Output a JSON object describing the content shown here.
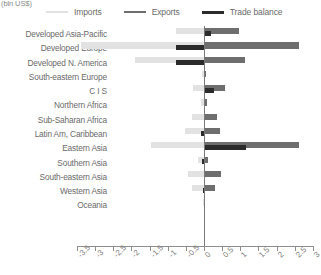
{
  "unit_label": "(bln US$)",
  "legend": {
    "position": "top",
    "items": [
      {
        "label": "Imports",
        "color": "#e2e2e2",
        "icon": "line-swatch-icon"
      },
      {
        "label": "Exports",
        "color": "#6e6e6e",
        "icon": "line-swatch-icon"
      },
      {
        "label": "Trade balance",
        "color": "#2b2b2b",
        "icon": "line-swatch-icon"
      }
    ]
  },
  "chart_data": {
    "type": "bar",
    "orientation": "horizontal",
    "title": "",
    "subtitle": "",
    "xlabel": "(bln US$)",
    "ylabel": "",
    "xlim": [
      -3.5,
      3.0
    ],
    "grid": false,
    "legend_position": "top",
    "zero_line": 0,
    "xticks": [
      -3.5,
      -3,
      -2.5,
      -2,
      -1.5,
      -1,
      -0.5,
      0,
      0.5,
      1,
      1.5,
      2,
      2.5,
      3
    ],
    "xticklabels": [
      "-3.5",
      "-3",
      "-2.5",
      "-2",
      "-1.5",
      "-1",
      "-0.5",
      "0",
      "0.5",
      "1",
      "1.5",
      "2",
      "2.5",
      "3"
    ],
    "categories": [
      "Developed Asia-Pacific",
      "Developed Europe",
      "Developed N. America",
      "South-eastern Europe",
      "C I S",
      "Northern Africa",
      "Sub-Saharan Africa",
      "Latin Am, Caribbean",
      "Eastern Asia",
      "Southern Asia",
      "South-eastern Asia",
      "Western Asia",
      "Oceania"
    ],
    "series": [
      {
        "name": "Imports",
        "color": "#e2e2e2",
        "values": [
          -0.78,
          -3.4,
          -1.9,
          -0.05,
          -0.3,
          -0.08,
          -0.32,
          -0.52,
          -1.45,
          -0.16,
          -0.44,
          -0.34,
          -0.02
        ]
      },
      {
        "name": "Exports",
        "color": "#6e6e6e",
        "values": [
          0.96,
          2.62,
          1.12,
          0.05,
          0.58,
          0.09,
          0.36,
          0.43,
          2.62,
          0.1,
          0.48,
          0.3,
          0.02
        ]
      },
      {
        "name": "Trade balance",
        "color": "#2b2b2b",
        "values": [
          0.18,
          -0.78,
          -0.78,
          0.0,
          0.28,
          0.01,
          0.04,
          -0.09,
          1.17,
          -0.06,
          0.04,
          -0.04,
          0.0
        ]
      }
    ]
  }
}
